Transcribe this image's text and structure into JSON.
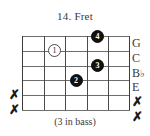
{
  "title": "14. Fret",
  "caption": "(3 in bass)",
  "colors": {
    "background": "#ffffff",
    "string_line": "#6e6e6e",
    "fret_line": "#4a4a4a",
    "dot_filled": "#111111",
    "dot_open_fill": "#ffffff",
    "text": "#3a3a3a"
  },
  "chart_data": {
    "type": "table",
    "title": "14. Fret",
    "subtitle": "(3 in bass)",
    "strings": 6,
    "frets": 5,
    "categories": [
      "string 1",
      "string 2",
      "string 3",
      "string 4",
      "string 5",
      "string 6"
    ],
    "note_labels": [
      "G",
      "C",
      "B♭",
      "E",
      "✗",
      "✗"
    ],
    "left_markers": [
      "",
      "",
      "",
      "",
      "✗",
      "✗"
    ],
    "fingerings": [
      {
        "finger": "4",
        "string": 1,
        "fret": 4,
        "style": "filled"
      },
      {
        "finger": "1",
        "string": 2,
        "fret": 2,
        "style": "open"
      },
      {
        "finger": "3",
        "string": 3,
        "fret": 4,
        "style": "filled"
      },
      {
        "finger": "2",
        "string": 4,
        "fret": 3,
        "style": "filled"
      }
    ],
    "xlabel": "",
    "ylabel": "",
    "grid": true
  },
  "fretboard": {
    "string_count": 6,
    "fret_count": 5,
    "mute_symbol": "✗"
  },
  "notes": [
    {
      "label": "G",
      "accidental": ""
    },
    {
      "label": "C",
      "accidental": ""
    },
    {
      "label": "B",
      "accidental": "♭"
    },
    {
      "label": "E",
      "accidental": ""
    },
    {
      "label": "✗",
      "accidental": ""
    },
    {
      "label": "✗",
      "accidental": ""
    }
  ],
  "dots": [
    {
      "num": "4"
    },
    {
      "num": "1"
    },
    {
      "num": "3"
    },
    {
      "num": "2"
    }
  ],
  "mutes": [
    {
      "symbol": "✗"
    },
    {
      "symbol": "✗"
    }
  ]
}
